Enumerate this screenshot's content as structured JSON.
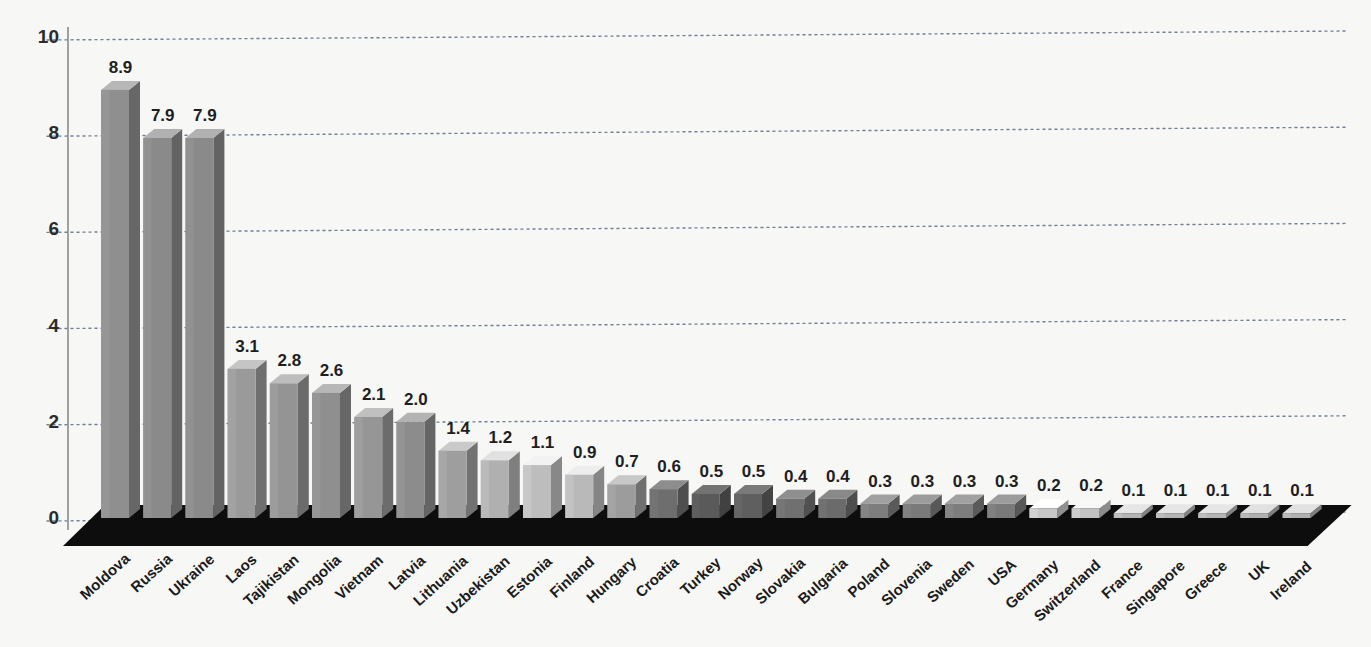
{
  "chart_data": {
    "type": "bar",
    "title": "",
    "subtitle": "",
    "xlabel": "",
    "ylabel": "",
    "ylim": [
      0,
      10
    ],
    "yticks": [
      0,
      2,
      4,
      6,
      8,
      10
    ],
    "ytick_labels": [
      "0",
      "2",
      "4",
      "6",
      "8",
      "10"
    ],
    "grid": true,
    "grid_style": "dotted-horizontal",
    "legend": "none",
    "style": "3d-isometric-bars-on-dark-floor",
    "categories": [
      "Moldova",
      "Russia",
      "Ukraine",
      "Laos",
      "Tajikistan",
      "Mongolia",
      "Vietnam",
      "Latvia",
      "Lithuania",
      "Uzbekistan",
      "Estonia",
      "Finland",
      "Hungary",
      "Croatia",
      "Turkey",
      "Norway",
      "Slovakia",
      "Bulgaria",
      "Poland",
      "Slovenia",
      "Sweden",
      "USA",
      "Germany",
      "Switzerland",
      "France",
      "Singapore",
      "Greece",
      "UK",
      "Ireland"
    ],
    "values": [
      8.9,
      7.9,
      7.9,
      3.1,
      2.8,
      2.6,
      2.1,
      2.0,
      1.4,
      1.2,
      1.1,
      0.9,
      0.7,
      0.6,
      0.5,
      0.5,
      0.4,
      0.4,
      0.3,
      0.3,
      0.3,
      0.3,
      0.2,
      0.2,
      0.1,
      0.1,
      0.1,
      0.1,
      0.1
    ],
    "value_labels": [
      "8.9",
      "7.9",
      "7.9",
      "3.1",
      "2.8",
      "2.6",
      "2.1",
      "2.0",
      "1.4",
      "1.2",
      "1.1",
      "0.9",
      "0.7",
      "0.6",
      "0.5",
      "0.5",
      "0.4",
      "0.4",
      "0.3",
      "0.3",
      "0.3",
      "0.3",
      "0.2",
      "0.2",
      "0.1",
      "0.1",
      "0.1",
      "0.1",
      "0.1"
    ],
    "bar_shades": [
      "#8f8f8f",
      "#8a8a8a",
      "#8a8a8a",
      "#9a9a9a",
      "#949494",
      "#8f8f8f",
      "#969696",
      "#8c8c8c",
      "#9e9e9e",
      "#b0b0b0",
      "#bdbdbd",
      "#b9b9b9",
      "#9c9c9c",
      "#6e6e6e",
      "#5a5a5a",
      "#5f5f5f",
      "#707070",
      "#6b6b6b",
      "#7d7d7d",
      "#7a7a7a",
      "#7d7d7d",
      "#7a7a7a",
      "#c7c7c7",
      "#c2c2c2",
      "#b4b4b4",
      "#b4b4b4",
      "#b4b4b4",
      "#b0b0b0",
      "#b0b0b0"
    ]
  },
  "colors": {
    "background": "#f7f7f5",
    "axis": "#8a8a8a",
    "gridline": "#5b6b86",
    "floor": "#0d0d0d",
    "tick_text": "#2b2b2b",
    "value_text": "#1e1e1e",
    "category_text": "#1b1b1b"
  },
  "geometry": {
    "y_zero_px": 518,
    "y_top_px": 37,
    "bar_pitch_px": 42.2,
    "bar_width_px": 28,
    "first_bar_left_px": 101,
    "depth_x_px": 11,
    "depth_y_px": 9
  }
}
